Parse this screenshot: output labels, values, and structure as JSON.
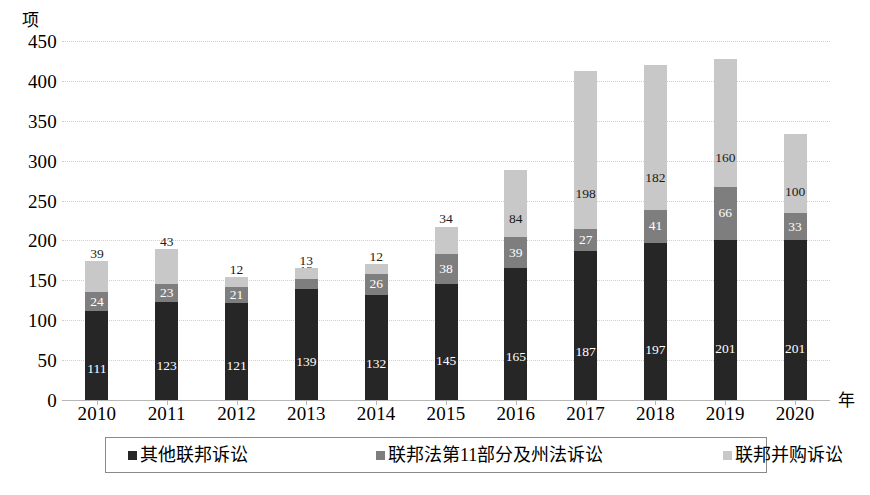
{
  "chart_data": {
    "type": "bar",
    "stacked": true,
    "title": "",
    "xlabel": "年",
    "ylabel": "项",
    "ylim": [
      0,
      450
    ],
    "ytick_step": 50,
    "yticks": [
      0,
      50,
      100,
      150,
      200,
      250,
      300,
      350,
      400,
      450
    ],
    "grid": true,
    "legend_position": "bottom",
    "categories": [
      "2010",
      "2011",
      "2012",
      "2013",
      "2014",
      "2015",
      "2016",
      "2017",
      "2018",
      "2019",
      "2020"
    ],
    "series": [
      {
        "name": "其他联邦诉讼",
        "color": "#262626",
        "values": [
          111,
          123,
          121,
          139,
          132,
          145,
          165,
          187,
          197,
          201,
          201
        ]
      },
      {
        "name": "联邦法第11部分及州法诉讼",
        "color": "#7e7e7e",
        "values": [
          24,
          23,
          21,
          13,
          26,
          38,
          39,
          27,
          41,
          66,
          33
        ]
      },
      {
        "name": "联邦并购诉讼",
        "color": "#c8c8c8",
        "values": [
          39,
          43,
          12,
          13,
          12,
          34,
          84,
          198,
          182,
          160,
          100
        ]
      }
    ],
    "totals": [
      174,
      189,
      154,
      165,
      170,
      217,
      288,
      412,
      420,
      427,
      334
    ]
  }
}
